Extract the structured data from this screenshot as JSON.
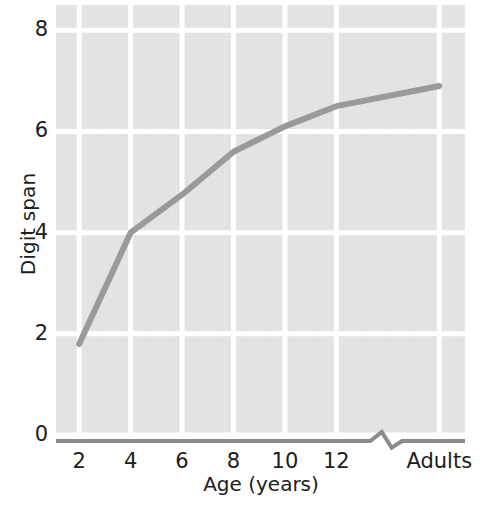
{
  "figure": {
    "name": "digit-span-vs-age-line-chart",
    "background_color": "#ffffff",
    "panel_color": "#e2e2e2",
    "gridline_color": "#ffffff",
    "line_color": "#9a9a9a",
    "axis_color": "#8c8c8c",
    "text_color": "#1c1c1c"
  },
  "chart_data": {
    "type": "line",
    "title": "",
    "xlabel": "Age (years)",
    "ylabel": "Digit span",
    "x_tick_labels": [
      "2",
      "4",
      "6",
      "8",
      "10",
      "12",
      "Adults"
    ],
    "x_tick_values": [
      2,
      4,
      6,
      8,
      10,
      12,
      16
    ],
    "y_tick_labels": [
      "0",
      "2",
      "4",
      "6",
      "8"
    ],
    "y_tick_values": [
      0,
      2,
      4,
      6,
      8
    ],
    "ylim": [
      0,
      8.5
    ],
    "xlim": [
      1.1,
      17
    ],
    "grid": true,
    "legend": false,
    "axis_break": {
      "axis": "x",
      "between_labels": [
        "12",
        "Adults"
      ],
      "marker": "zigzag"
    },
    "series": [
      {
        "name": "Digit span",
        "color": "#9a9a9a",
        "line_width": 6,
        "markers": false,
        "x": [
          2,
          4,
          6,
          8,
          9,
          10,
          12,
          16
        ],
        "y": [
          1.8,
          4.0,
          4.75,
          5.6,
          5.85,
          6.1,
          6.5,
          6.9
        ]
      }
    ]
  }
}
